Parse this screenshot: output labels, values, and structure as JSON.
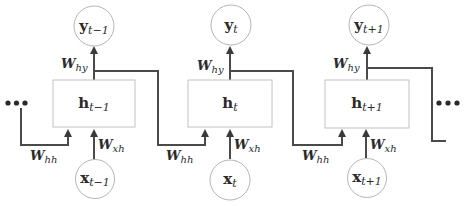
{
  "diagram": {
    "colors": {
      "wire": "#4a4a4a",
      "node_stroke": "#b5b5b5",
      "box_stroke": "#c2c2c2",
      "text": "#2b2b2b"
    },
    "ellipsis": "•••",
    "steps": [
      {
        "hidden": {
          "base": "h",
          "sub": "t−1"
        },
        "output": {
          "base": "y",
          "sub": "t−1"
        },
        "input": {
          "base": "x",
          "sub": "t−1"
        },
        "w_out": {
          "base": "W",
          "sub": "hy"
        },
        "w_in": {
          "base": "W",
          "sub": "xh"
        },
        "w_rec": {
          "base": "W",
          "sub": "hh"
        }
      },
      {
        "hidden": {
          "base": "h",
          "sub": "t"
        },
        "output": {
          "base": "y",
          "sub": "t"
        },
        "input": {
          "base": "x",
          "sub": "t"
        },
        "w_out": {
          "base": "W",
          "sub": "hy"
        },
        "w_in": {
          "base": "W",
          "sub": "xh"
        },
        "w_rec": {
          "base": "W",
          "sub": "hh"
        }
      },
      {
        "hidden": {
          "base": "h",
          "sub": "t+1"
        },
        "output": {
          "base": "y",
          "sub": "t+1"
        },
        "input": {
          "base": "x",
          "sub": "t+1"
        },
        "w_out": {
          "base": "W",
          "sub": "hy"
        },
        "w_in": {
          "base": "W",
          "sub": "xh"
        },
        "w_rec": {
          "base": "W",
          "sub": "hh"
        }
      }
    ]
  }
}
